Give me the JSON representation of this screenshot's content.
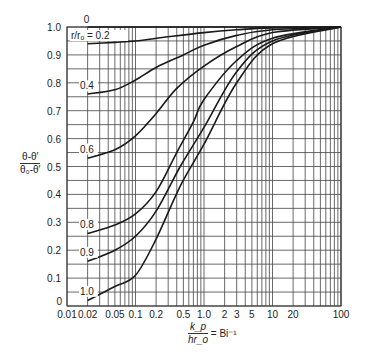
{
  "chart_data": {
    "type": "line",
    "title": "",
    "xlabel_num": "k_p",
    "xlabel_den": "hr_o",
    "xlabel_suffix": "= Bi⁻¹",
    "ylabel_num": "θ-θ′",
    "ylabel_den": "θ₀-θ′",
    "xscale": "log",
    "xlim": [
      0.01,
      100
    ],
    "ylim": [
      0,
      1.0
    ],
    "grid": true,
    "x_ticks": [
      {
        "v": 0.01,
        "label": "0.01"
      },
      {
        "v": 0.02,
        "label": "0.02"
      },
      {
        "v": 0.05,
        "label": "0.05"
      },
      {
        "v": 0.1,
        "label": "0.1"
      },
      {
        "v": 0.2,
        "label": "0.2"
      },
      {
        "v": 0.5,
        "label": "0.5"
      },
      {
        "v": 1,
        "label": "1.0"
      },
      {
        "v": 2,
        "label": "2"
      },
      {
        "v": 3,
        "label": "3"
      },
      {
        "v": 5,
        "label": "5"
      },
      {
        "v": 10,
        "label": "10"
      },
      {
        "v": 20,
        "label": "20"
      },
      {
        "v": 100,
        "label": "100"
      }
    ],
    "y_ticks": [
      {
        "v": 0,
        "label": "0"
      },
      {
        "v": 0.1,
        "label": "0.1"
      },
      {
        "v": 0.2,
        "label": "0.2"
      },
      {
        "v": 0.3,
        "label": "0.3"
      },
      {
        "v": 0.4,
        "label": "0.4"
      },
      {
        "v": 0.5,
        "label": "0.5"
      },
      {
        "v": 0.6,
        "label": "0.6"
      },
      {
        "v": 0.7,
        "label": "0.7"
      },
      {
        "v": 0.8,
        "label": "0.8"
      },
      {
        "v": 0.9,
        "label": "0.9"
      },
      {
        "v": 1.0,
        "label": "1.0"
      }
    ],
    "series": [
      {
        "name": "0",
        "label": "0",
        "x": [
          0.02,
          100
        ],
        "y": [
          1.0,
          1.0
        ]
      },
      {
        "name": "0.2",
        "label": "r/r_o = 0.2",
        "x": [
          0.02,
          0.05,
          0.1,
          0.3,
          1,
          3,
          10,
          100
        ],
        "y": [
          0.94,
          0.945,
          0.95,
          0.965,
          0.98,
          0.99,
          0.997,
          1.0
        ]
      },
      {
        "name": "0.4",
        "label": "0.4",
        "x": [
          0.02,
          0.05,
          0.1,
          0.2,
          0.5,
          1,
          3,
          10,
          100
        ],
        "y": [
          0.76,
          0.775,
          0.81,
          0.855,
          0.9,
          0.935,
          0.97,
          0.99,
          1.0
        ]
      },
      {
        "name": "0.6",
        "label": "0.6",
        "x": [
          0.02,
          0.05,
          0.1,
          0.2,
          0.4,
          1,
          3,
          10,
          100
        ],
        "y": [
          0.53,
          0.56,
          0.61,
          0.69,
          0.78,
          0.86,
          0.93,
          0.98,
          1.0
        ]
      },
      {
        "name": "0.8",
        "label": "0.8",
        "x": [
          0.02,
          0.05,
          0.1,
          0.2,
          0.4,
          0.7,
          1,
          3,
          10,
          100
        ],
        "y": [
          0.26,
          0.29,
          0.33,
          0.41,
          0.55,
          0.66,
          0.74,
          0.88,
          0.96,
          1.0
        ]
      },
      {
        "name": "0.9",
        "label": "0.9",
        "x": [
          0.02,
          0.05,
          0.1,
          0.2,
          0.45,
          1,
          3,
          10,
          100
        ],
        "y": [
          0.16,
          0.2,
          0.25,
          0.34,
          0.5,
          0.64,
          0.84,
          0.95,
          1.0
        ]
      },
      {
        "name": "1.0",
        "label": "1.0",
        "x": [
          0.02,
          0.05,
          0.1,
          0.2,
          0.45,
          1,
          3,
          10,
          100
        ],
        "y": [
          0.02,
          0.07,
          0.11,
          0.24,
          0.43,
          0.58,
          0.8,
          0.94,
          1.0
        ]
      }
    ]
  },
  "layout": {
    "plot_left": 67,
    "plot_right": 341,
    "plot_top": 27,
    "plot_bottom": 306
  }
}
